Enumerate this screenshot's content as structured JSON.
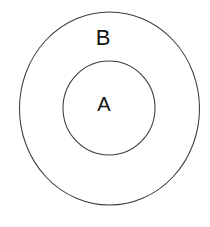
{
  "diagram": {
    "type": "euler-diagram",
    "background_color": "#ffffff",
    "stroke_color": "#3a3a3a",
    "label_color": "#141414",
    "canvas": {
      "width": 210,
      "height": 227
    },
    "sets": [
      {
        "id": "outer",
        "label": "B",
        "shape": "ellipse",
        "center_x": 109.5,
        "center_y": 108.5,
        "radius_x": 90,
        "radius_y": 96.5,
        "fill": "none",
        "stroke_width": 1
      },
      {
        "id": "inner",
        "label": "A",
        "shape": "ellipse",
        "center_x": 109,
        "center_y": 108,
        "radius_x": 46,
        "radius_y": 47,
        "fill": "none",
        "stroke_width": 1
      }
    ]
  },
  "chart_data": {
    "type": "diagram",
    "subtype": "euler",
    "title": "",
    "categories": [
      "B",
      "A"
    ],
    "relation": "A ⊂ B",
    "regions": [
      {
        "label": "B",
        "contains": [
          "A"
        ],
        "position": "outer-annulus-top"
      },
      {
        "label": "A",
        "contains": [],
        "position": "inner-center"
      }
    ]
  }
}
